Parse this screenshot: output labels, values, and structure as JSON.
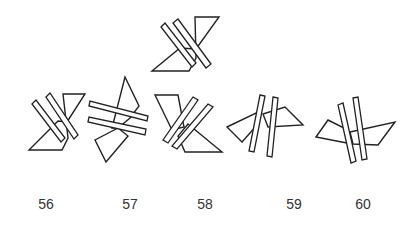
{
  "puzzle": {
    "reference_figure": {
      "label": "",
      "description": "reference shape: triangle-quadrilateral with two parallel crossing bars"
    },
    "options": [
      {
        "label": "56",
        "x": 46
      },
      {
        "label": "57",
        "x": 130
      },
      {
        "label": "58",
        "x": 205
      },
      {
        "label": "59",
        "x": 294
      },
      {
        "label": "60",
        "x": 363
      }
    ]
  },
  "colors": {
    "stroke": "#222222",
    "fill": "#ffffff",
    "label": "#333333"
  }
}
